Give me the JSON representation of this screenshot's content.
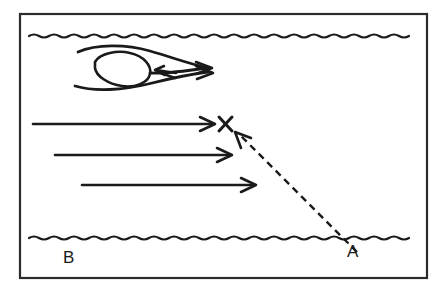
{
  "figure": {
    "background_color": "#ffffff",
    "ink_color": "#1a1a1a",
    "frame": {
      "x": 19,
      "y": 13,
      "width": 409,
      "height": 266,
      "stroke_color": "#2b2b2b"
    }
  },
  "labels": {
    "point_a": "A",
    "point_b": "B",
    "target_marker": "X"
  },
  "banks": {
    "top_bank_label": "top-bank-wavy-line",
    "bottom_bank_label": "bottom-bank-wavy-line",
    "top_bank_y": 36,
    "bottom_bank_y": 238
  },
  "flow_arrows": [
    {
      "name": "flow-arrow-1",
      "x1": 33,
      "y1": 124,
      "x2": 215,
      "y2": 124
    },
    {
      "name": "flow-arrow-2",
      "x1": 55,
      "y1": 155,
      "x2": 232,
      "y2": 155
    },
    {
      "name": "flow-arrow-3",
      "x1": 82,
      "y1": 185,
      "x2": 256,
      "y2": 185
    }
  ],
  "eddy": {
    "name": "eddy-vortex",
    "inner_arrow_direction": "left",
    "outflow_arrow_count": 2
  },
  "sight_line": {
    "name": "sighting-dashed-line",
    "from": "A",
    "to": "X",
    "from_x": 357,
    "from_y": 252,
    "to_x": 236,
    "to_y": 131,
    "style": "dashed",
    "arrow_at": "X"
  },
  "marker": {
    "name": "target-x-marker",
    "x": 225,
    "y": 124
  }
}
